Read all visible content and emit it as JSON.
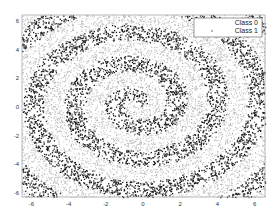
{
  "chart_data": {
    "type": "scatter",
    "title": "",
    "xlabel": "",
    "ylabel": "",
    "xlim": [
      -6.5,
      6.5
    ],
    "ylim": [
      -6.3,
      6.5
    ],
    "xticks": [
      -6,
      -4,
      -2,
      0,
      2,
      4,
      6
    ],
    "yticks": [
      -6,
      -4,
      -2,
      0,
      2,
      4,
      6
    ],
    "grid": false,
    "legend_position": "upper right",
    "series": [
      {
        "name": "Class 0",
        "color": "#bdbdbd",
        "marker": "dot",
        "description": "background region between spiral arms (light gray points)"
      },
      {
        "name": "Class 1",
        "color": "#1a1a1a",
        "marker": "dot",
        "description": "spiral arm region (dark points), spiral from center outward ~3 turns, arm spacing ~2.2 units"
      }
    ],
    "spiral": {
      "center": [
        -0.4,
        0.3
      ],
      "growth_per_radian": 0.35,
      "arm_half_width": 0.55
    }
  },
  "legend": {
    "items": [
      {
        "label": "Class 0"
      },
      {
        "label": "Class 1"
      }
    ]
  }
}
